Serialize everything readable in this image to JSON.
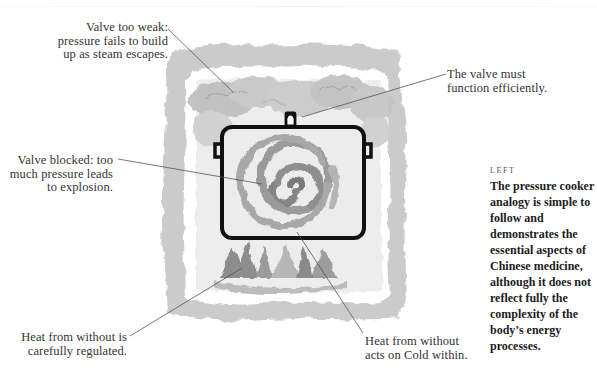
{
  "illustration": {
    "subject": "pressure-cooker-analogy",
    "colors": {
      "frame_wash": "#b9b9b9",
      "steam_wash": "#c8c8c8",
      "pot_outline": "#111111",
      "spiral": "#8f8f8f",
      "flames": "#8a8a8a",
      "leader_line": "#555555"
    }
  },
  "callouts": {
    "valve_weak": {
      "lines": [
        "Valve too weak:",
        "pressure fails to build",
        "up as steam escapes."
      ]
    },
    "valve_efficient": {
      "lines": [
        "The valve must",
        "function efficiently."
      ]
    },
    "valve_blocked": {
      "lines": [
        "Valve blocked: too",
        "much pressure leads",
        "to explosion."
      ]
    },
    "heat_regulated": {
      "lines": [
        "Heat from without is",
        "carefully regulated."
      ]
    },
    "heat_cold": {
      "lines": [
        "Heat from without",
        "acts on Cold within."
      ]
    }
  },
  "sidebar": {
    "kicker": "LEFT",
    "body_lines": [
      "The pressure cooker",
      "analogy is simple to",
      "follow and",
      "demonstrates the",
      "essential aspects of",
      "Chinese medicine,",
      "although it does not",
      "reflect fully the",
      "complexity of the",
      "body’s energy",
      "processes."
    ]
  }
}
